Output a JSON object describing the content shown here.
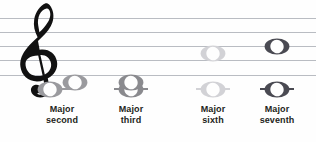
{
  "figure": {
    "kind": "music-notation-staff",
    "clef": "treble-clef",
    "background_color": "#fefefe",
    "staff": {
      "line_color": "#b9bcc2",
      "line_count": 5,
      "line_y": [
        18,
        32,
        46,
        60,
        75
      ],
      "left": 0,
      "right": 316
    }
  },
  "intervals": [
    {
      "name": "major-second",
      "caption_line1": "Major",
      "caption_line2": "second",
      "color": "#9a9a9e",
      "x": 62,
      "ledger": true,
      "ledger_y": 89,
      "notes": [
        {
          "y": 89,
          "offset": "left"
        },
        {
          "y": 82,
          "offset": "right"
        }
      ]
    },
    {
      "name": "major-third",
      "caption_line1": "Major",
      "caption_line2": "third",
      "color": "#8a8a8e",
      "x": 131,
      "ledger": true,
      "ledger_y": 89,
      "notes": [
        {
          "y": 89,
          "offset": "center"
        },
        {
          "y": 82,
          "offset": "center"
        }
      ]
    },
    {
      "name": "major-sixth",
      "caption_line1": "Major",
      "caption_line2": "sixth",
      "color": "#d2d2d6",
      "x": 213,
      "ledger": true,
      "ledger_y": 89,
      "notes": [
        {
          "y": 89,
          "offset": "center"
        },
        {
          "y": 53,
          "offset": "center"
        }
      ]
    },
    {
      "name": "major-seventh",
      "caption_line1": "Major",
      "caption_line2": "seventh",
      "color": "#4a4a52",
      "x": 277,
      "ledger": true,
      "ledger_y": 89,
      "notes": [
        {
          "y": 89,
          "offset": "center"
        },
        {
          "y": 46,
          "offset": "center"
        }
      ]
    }
  ]
}
